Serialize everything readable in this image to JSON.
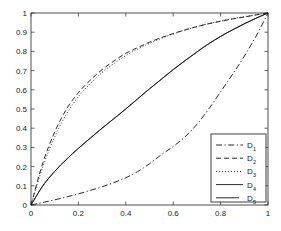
{
  "chart_data": {
    "type": "line",
    "title": "",
    "xlabel": "",
    "ylabel": "",
    "xlim": [
      0,
      1
    ],
    "ylim": [
      0,
      1
    ],
    "grid": false,
    "legend_position": "lower right",
    "xticks": [
      "0",
      "0.2",
      "0.4",
      "0.6",
      "0.8",
      "1"
    ],
    "xtick_values": [
      0,
      0.2,
      0.4,
      0.6,
      0.8,
      1
    ],
    "yticks": [
      "0",
      "0.1",
      "0.2",
      "0.3",
      "0.4",
      "0.5",
      "0.6",
      "0.7",
      "0.8",
      "0.9",
      "1"
    ],
    "ytick_values": [
      0,
      0.1,
      0.2,
      0.3,
      0.4,
      0.5,
      0.6,
      0.7,
      0.8,
      0.9,
      1
    ],
    "x": [
      0,
      0.05,
      0.1,
      0.15,
      0.2,
      0.25,
      0.3,
      0.35,
      0.4,
      0.45,
      0.5,
      0.55,
      0.6,
      0.65,
      0.7,
      0.75,
      0.8,
      0.85,
      0.9,
      0.95,
      1
    ],
    "series": [
      {
        "name": "D_1",
        "label": "D",
        "subscript": "1",
        "linestyle": "dashdot",
        "color": "#1f1f1f",
        "values": [
          0,
          0.013,
          0.027,
          0.042,
          0.058,
          0.076,
          0.095,
          0.117,
          0.142,
          0.174,
          0.215,
          0.262,
          0.305,
          0.355,
          0.42,
          0.5,
          0.59,
          0.68,
          0.775,
          0.88,
          1
        ]
      },
      {
        "name": "D_2",
        "label": "D",
        "subscript": "2",
        "linestyle": "dashed",
        "color": "#1f1f1f",
        "values": [
          0,
          0.22,
          0.38,
          0.5,
          0.585,
          0.65,
          0.705,
          0.75,
          0.79,
          0.82,
          0.848,
          0.872,
          0.893,
          0.912,
          0.929,
          0.944,
          0.957,
          0.969,
          0.979,
          0.99,
          1
        ]
      },
      {
        "name": "D_3",
        "label": "D",
        "subscript": "3",
        "linestyle": "dotted",
        "color": "#1f1f1f",
        "values": [
          0,
          0.2,
          0.355,
          0.475,
          0.565,
          0.632,
          0.69,
          0.737,
          0.778,
          0.812,
          0.842,
          0.868,
          0.891,
          0.911,
          0.929,
          0.945,
          0.958,
          0.97,
          0.981,
          0.991,
          1
        ]
      },
      {
        "name": "D_4",
        "label": "D",
        "subscript": "4",
        "linestyle": "solid",
        "color": "#1f1f1f",
        "values": [
          0,
          0.1,
          0.175,
          0.238,
          0.295,
          0.348,
          0.4,
          0.45,
          0.5,
          0.553,
          0.605,
          0.655,
          0.705,
          0.752,
          0.797,
          0.84,
          0.878,
          0.912,
          0.944,
          0.973,
          1
        ]
      },
      {
        "name": "D_5",
        "label": "D",
        "subscript": "5",
        "linestyle": "solid",
        "color": "#1f1f1f",
        "values": [
          0,
          0.1,
          0.175,
          0.238,
          0.295,
          0.348,
          0.4,
          0.45,
          0.5,
          0.553,
          0.605,
          0.655,
          0.705,
          0.752,
          0.797,
          0.84,
          0.878,
          0.912,
          0.944,
          0.973,
          1
        ]
      }
    ]
  },
  "legend": {
    "entries": [
      {
        "label": "D",
        "subscript": "1",
        "linestyle": "dashdot"
      },
      {
        "label": "D",
        "subscript": "2",
        "linestyle": "dashed"
      },
      {
        "label": "D",
        "subscript": "3",
        "linestyle": "dotted"
      },
      {
        "label": "D",
        "subscript": "4",
        "linestyle": "solid"
      },
      {
        "label": "D",
        "subscript": "5",
        "linestyle": "solid"
      }
    ]
  }
}
